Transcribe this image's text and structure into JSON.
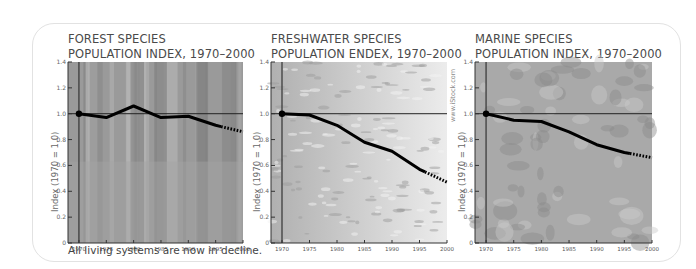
{
  "caption": "All living systems are now in decline.",
  "credit": "www.iStock.com",
  "panels": [
    {
      "title_line1": "FOREST SPECIES",
      "title_line2": "POPULATION INDEX, 1970–2000",
      "ylabel": "Index (1970 = 1.0)"
    },
    {
      "title_line1": "FRESHWATER SPECIES",
      "title_line2": "POPULATION ENDEX, 1970–2000",
      "ylabel": "Index (1970 = 1.0)"
    },
    {
      "title_line1": "MARINE SPECIES",
      "title_line2": "POPULATION INDEX, 1970–2000",
      "ylabel": "Index (1970 = 1.0)"
    }
  ],
  "chart_data": [
    {
      "type": "line",
      "title": "FOREST SPECIES POPULATION INDEX, 1970–2000",
      "xlabel": "",
      "ylabel": "Index (1970 = 1.0)",
      "x": [
        1970,
        1975,
        1980,
        1985,
        1990,
        1995,
        2000
      ],
      "series": [
        {
          "name": "Forest species index",
          "values": [
            1.0,
            0.97,
            1.06,
            0.97,
            0.98,
            0.91,
            0.86
          ],
          "dashed_from": 1996
        }
      ],
      "xticks": [
        "1970",
        "1975",
        "1980",
        "1985",
        "1990",
        "1995",
        "2000"
      ],
      "yticks": [
        "0",
        "0.2",
        "0.4",
        "0.6",
        "0.8",
        "1.0",
        "1.2",
        "1.4"
      ],
      "ylim": [
        0,
        1.4
      ],
      "xlim": [
        1968,
        2000
      ],
      "reference_line": 1.0,
      "grid": false,
      "background": "forest photo (grayscale)"
    },
    {
      "type": "line",
      "title": "FRESHWATER SPECIES POPULATION ENDEX, 1970–2000",
      "xlabel": "",
      "ylabel": "Index (1970 = 1.0)",
      "x": [
        1970,
        1975,
        1980,
        1985,
        1990,
        1995,
        2000
      ],
      "series": [
        {
          "name": "Freshwater species index",
          "values": [
            1.0,
            0.99,
            0.91,
            0.78,
            0.71,
            0.57,
            0.47
          ],
          "dashed_from": 1996
        }
      ],
      "xticks": [
        "1970",
        "1975",
        "1980",
        "1985",
        "1990",
        "1995",
        "2000"
      ],
      "yticks": [
        "0",
        "0.2",
        "0.4",
        "0.6",
        "0.8",
        "1.0",
        "1.2",
        "1.4"
      ],
      "ylim": [
        0,
        1.4
      ],
      "xlim": [
        1968,
        2000
      ],
      "reference_line": 1.0,
      "grid": false,
      "background": "water surface photo (grayscale)"
    },
    {
      "type": "line",
      "title": "MARINE SPECIES POPULATION INDEX, 1970–2000",
      "xlabel": "",
      "ylabel": "Index (1970 = 1.0)",
      "x": [
        1970,
        1975,
        1980,
        1985,
        1990,
        1995,
        2000
      ],
      "series": [
        {
          "name": "Marine species index",
          "values": [
            1.0,
            0.95,
            0.94,
            0.86,
            0.76,
            0.7,
            0.66
          ],
          "dashed_from": 1996
        }
      ],
      "xticks": [
        "1970",
        "1975",
        "1980",
        "1985",
        "1990",
        "1995",
        "2000"
      ],
      "yticks": [
        "0",
        "0.2",
        "0.4",
        "0.6",
        "0.8",
        "1.0",
        "1.2",
        "1.4"
      ],
      "ylim": [
        0,
        1.4
      ],
      "xlim": [
        1968,
        2000
      ],
      "reference_line": 1.0,
      "grid": false,
      "background": "coral reef photo (grayscale)"
    }
  ]
}
